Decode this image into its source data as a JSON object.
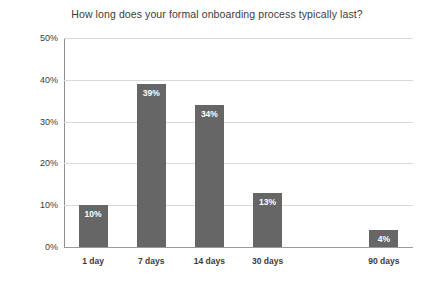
{
  "chart_data": {
    "type": "bar",
    "title": "How long does your formal onboarding process typically last?",
    "xlabel": "",
    "ylabel": "Percentage of all respondents",
    "categories": [
      "1 day",
      "7 days",
      "14 days",
      "30 days",
      "",
      "90 days"
    ],
    "values": [
      10,
      39,
      34,
      13,
      0,
      4
    ],
    "value_labels": [
      "10%",
      "39%",
      "34%",
      "13%",
      "",
      "4%"
    ],
    "ylim": [
      0,
      50
    ],
    "yticks": [
      0,
      10,
      20,
      30,
      40,
      50
    ],
    "ytick_labels": [
      "0%",
      "10%",
      "20%",
      "30%",
      "40%",
      "50%"
    ],
    "grid": true,
    "legend": "none",
    "bar_color": "#666666",
    "gridline_color": "#d9d9d9",
    "axis_color": "#8f8f8f",
    "text_color": "#3b3b3b",
    "value_label_color": "#ffffff",
    "background_color": "#ffffff"
  }
}
